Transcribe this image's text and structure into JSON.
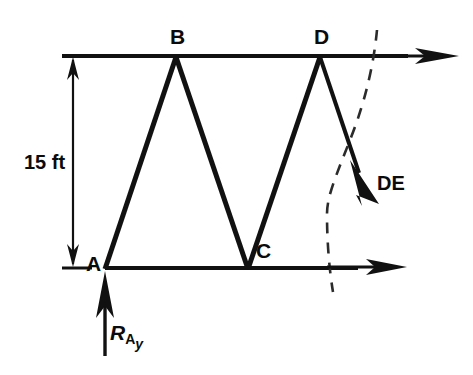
{
  "figure": {
    "type": "engineering-statics-diagram",
    "background_color": "#ffffff",
    "line_color": "#111111"
  },
  "labels": {
    "node_a": "A",
    "node_b": "B",
    "node_c": "C",
    "node_d": "D",
    "dimension_height": "15 ft",
    "force_de": "DE",
    "reaction_symbol": "R",
    "reaction_sub_a": "A",
    "reaction_sub_y": "y"
  },
  "geometry": {
    "joints": [
      {
        "name": "A",
        "x": 105,
        "y": 268
      },
      {
        "name": "B",
        "x": 176,
        "y": 56
      },
      {
        "name": "C",
        "x": 248,
        "y": 268
      },
      {
        "name": "D",
        "x": 320,
        "y": 56
      }
    ],
    "members": [
      {
        "name": "top-chord",
        "from": "left-end",
        "to": "right-end",
        "path": "62,56 176,56 320,56 395,56"
      },
      {
        "name": "bottom-chord",
        "from": "A",
        "to": "right-end",
        "path": "105,268 248,268 345,268"
      },
      {
        "name": "AB",
        "from": "A",
        "to": "B"
      },
      {
        "name": "BC",
        "from": "B",
        "to": "C"
      },
      {
        "name": "CD",
        "from": "C",
        "to": "D"
      },
      {
        "name": "DE",
        "from": "D",
        "to": "E-cut"
      }
    ],
    "dimension_line": {
      "x": 73,
      "y_top": 56,
      "y_bottom": 268,
      "value": "15 ft"
    },
    "section_cut": {
      "style": "dashed",
      "points": "377,30 372,70 352,140 328,205 328,250 333,292"
    },
    "force_arrows": [
      {
        "name": "top-chord-force",
        "direction": "right",
        "from_x": 320,
        "to_x": 458,
        "y": 56
      },
      {
        "name": "bottom-chord-force",
        "direction": "right",
        "from_x": 325,
        "to_x": 406,
        "y": 267
      },
      {
        "name": "DE-force",
        "direction": "down-right",
        "from": "320,56",
        "to": "370,207"
      },
      {
        "name": "reaction-RAy",
        "direction": "up",
        "x": 105,
        "from_y": 356,
        "to_y": 271
      }
    ]
  }
}
